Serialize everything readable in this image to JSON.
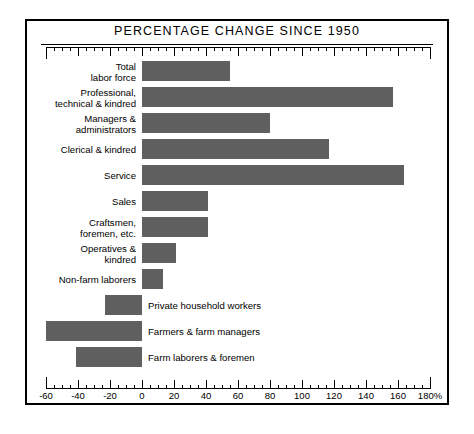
{
  "chart_data": {
    "type": "bar",
    "orientation": "horizontal",
    "title": "PERCENTAGE CHANGE SINCE 1950",
    "xlabel": "",
    "ylabel": "",
    "xlim": [
      -60,
      180
    ],
    "grid": false,
    "legend": "none",
    "axis_unit": "%",
    "tick_labels": [
      "-60",
      "-40",
      "-20",
      "0",
      "20",
      "40",
      "60",
      "80",
      "100",
      "120",
      "140",
      "160",
      "180%"
    ],
    "tick_values": [
      -60,
      -40,
      -20,
      0,
      20,
      40,
      60,
      80,
      100,
      120,
      140,
      160,
      180
    ],
    "minor_tick_step": 5,
    "categories": [
      "Total\nlabor force",
      "Professional,\ntechnical & kindred",
      "Managers &\nadministrators",
      "Clerical & kindred",
      "Service",
      "Sales",
      "Craftsmen,\nforemen, etc.",
      "Operatives &\nkindred",
      "Non-farm laborers",
      "Private household workers",
      "Farmers & farm managers",
      "Farm laborers & foremen"
    ],
    "values": [
      55,
      157,
      80,
      117,
      164,
      41,
      41,
      21,
      13,
      -23,
      -60,
      -41
    ],
    "bar_color": "#5f5f5f",
    "frame_color": "#000000",
    "background_color": "#ffffff"
  },
  "chart": {
    "title": "PERCENTAGE CHANGE SINCE 1950",
    "rows": [
      {
        "label": "Total\nlabor force",
        "value": 55,
        "label_side": "left"
      },
      {
        "label": "Professional,\ntechnical & kindred",
        "value": 157,
        "label_side": "left"
      },
      {
        "label": "Managers &\nadministrators",
        "value": 80,
        "label_side": "left"
      },
      {
        "label": "Clerical & kindred",
        "value": 117,
        "label_side": "left"
      },
      {
        "label": "Service",
        "value": 164,
        "label_side": "left"
      },
      {
        "label": "Sales",
        "value": 41,
        "label_side": "left"
      },
      {
        "label": "Craftsmen,\nforemen, etc.",
        "value": 41,
        "label_side": "left"
      },
      {
        "label": "Operatives &\nkindred",
        "value": 21,
        "label_side": "left"
      },
      {
        "label": "Non-farm laborers",
        "value": 13,
        "label_side": "left"
      },
      {
        "label": "Private household workers",
        "value": -23,
        "label_side": "right"
      },
      {
        "label": "Farmers & farm managers",
        "value": -60,
        "label_side": "right"
      },
      {
        "label": "Farm laborers & foremen",
        "value": -41,
        "label_side": "right"
      }
    ]
  }
}
